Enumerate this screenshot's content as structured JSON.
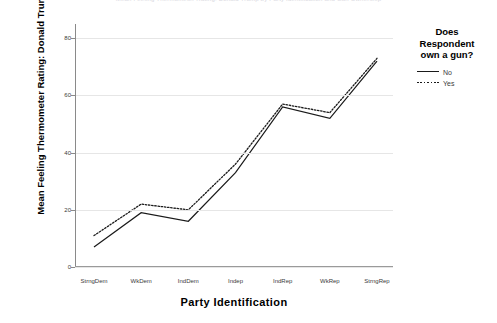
{
  "chart_data": {
    "type": "line",
    "title": "Mean Feeling Thermometer Rating: Donald Trump by Party Identification and Gun Ownership",
    "xlabel": "Party  Identification",
    "ylabel": "Mean Feeling Thermometer Rating: Donald Trump",
    "categories": [
      "StrngDem",
      "WkDem",
      "IndDem",
      "Indep",
      "IndRep",
      "WkRep",
      "StrngRep"
    ],
    "ylim": [
      0,
      85
    ],
    "yticks": [
      0,
      20,
      40,
      60,
      80
    ],
    "ytick_labels": [
      "0",
      "20",
      "40",
      "60",
      "80"
    ],
    "grid": true,
    "legend_position": "right",
    "legend_title": "Does Respondent own a gun?",
    "series": [
      {
        "name": "No",
        "style": "solid",
        "color": "#1a1a1a",
        "values": [
          7,
          19,
          16,
          33,
          56,
          52,
          72
        ]
      },
      {
        "name": "Yes",
        "style": "dotted",
        "color": "#1a1a1a",
        "values": [
          11,
          22,
          20,
          36,
          57,
          54,
          73
        ]
      }
    ]
  },
  "legend": {
    "title_line1": "Does",
    "title_line2": "Respondent",
    "title_line3": "own a gun?",
    "items": [
      {
        "label": "No",
        "style": "solid"
      },
      {
        "label": "Yes",
        "style": "dotted"
      }
    ]
  },
  "axes": {
    "y_title": "Mean Feeling Thermometer Rating: Donald Trump",
    "x_title": "Party  Identification"
  }
}
